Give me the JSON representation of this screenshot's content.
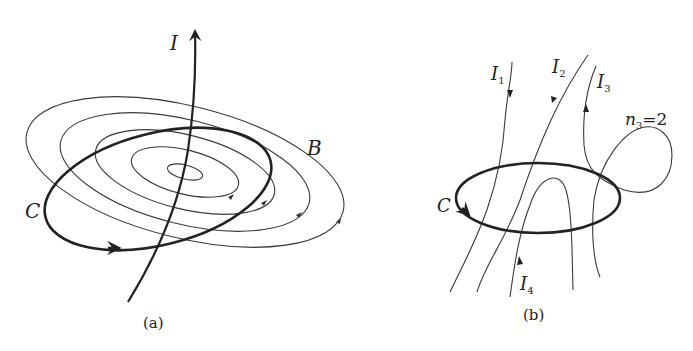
{
  "figure": {
    "panel_a": {
      "caption": "(a)",
      "labels": {
        "current": "I",
        "field": "B",
        "loop": "C"
      },
      "description": "Straight current I piercing concentric magnetic field lines B, with closed loop C encircling the current"
    },
    "panel_b": {
      "caption": "(b)",
      "labels": {
        "loop": "C",
        "currents": [
          {
            "name": "I",
            "sub": "1"
          },
          {
            "name": "I",
            "sub": "2"
          },
          {
            "name": "I",
            "sub": "3"
          },
          {
            "name": "I",
            "sub": "4"
          }
        ],
        "winding": {
          "name": "n",
          "sub": "3",
          "value": "=2"
        }
      },
      "description": "Closed loop C with several currents I1–I4 threading it; I3 winds through twice (n3 = 2)"
    }
  }
}
